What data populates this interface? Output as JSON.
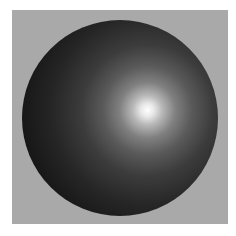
{
  "image": {
    "subject": "shaded 3D sphere",
    "background_color": "#a9a9a9",
    "border_color": "#ffffff",
    "sphere_base_color": "#1a1a1a",
    "highlight_color": "#ffffff"
  }
}
